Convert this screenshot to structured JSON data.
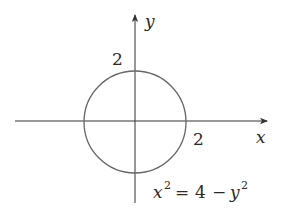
{
  "diagram": {
    "type": "circle-on-axes",
    "axes": {
      "x_label": "x",
      "y_label": "y"
    },
    "tick_labels": {
      "x_intercept": "2",
      "y_intercept": "2"
    },
    "equation": {
      "lhs_base": "x",
      "lhs_exp": "2",
      "equals": "=",
      "rhs_const": "4",
      "minus": "−",
      "rhs_base": "y",
      "rhs_exp": "2"
    },
    "colors": {
      "axis": "#333333",
      "circle": "#666666",
      "text": "#2a2a2a"
    }
  }
}
